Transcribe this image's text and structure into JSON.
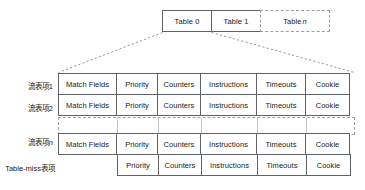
{
  "diagram": {
    "tables": [
      {
        "name": "table-0",
        "label": "Table 0",
        "style": "solid"
      },
      {
        "name": "table-1",
        "label": "Table 1",
        "style": "solid"
      },
      {
        "name": "table-n",
        "label": "Table ",
        "suffix": "n",
        "style": "dashed"
      }
    ],
    "columns": [
      "Match Fields",
      "Priority",
      "Counters",
      "Instructions",
      "Timeouts",
      "Cookie"
    ],
    "row_labels": {
      "entry_1": "流表项1",
      "entry_2": "流表项2",
      "entry_n_prefix": "流表项",
      "entry_n_suffix": "n",
      "table_miss": "Table-miss表项"
    },
    "rows": [
      {
        "label": "流表项1",
        "cells": [
          "Match Fields",
          "Priority",
          "Counters",
          "Instructions",
          "Timeouts",
          "Cookie"
        ]
      },
      {
        "label": "流表项2",
        "cells": [
          "Match Fields",
          "Priority",
          "Counters",
          "Instructions",
          "Timeouts",
          "Cookie"
        ]
      },
      {
        "label": "流表项n",
        "cells": [
          "Match Fields",
          "Priority",
          "Counters",
          "Instructions",
          "Timeouts",
          "Cookie"
        ]
      },
      {
        "label": "Table-miss表项",
        "cells": [
          "Priority",
          "Counters",
          "Instructions",
          "Timeouts",
          "Cookie"
        ]
      }
    ],
    "colors": {
      "line": "#5f6368",
      "dashed_line": "#9aa0a6",
      "text": "#1a1a1a",
      "background": "#ffffff"
    }
  }
}
